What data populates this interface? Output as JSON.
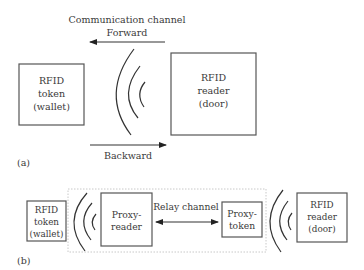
{
  "figure": {
    "part_a": {
      "label": "(a)",
      "channel_title": "Communication channel",
      "forward_label": "Forward",
      "backward_label": "Backward",
      "token": {
        "line1": "RFID",
        "line2": "token",
        "line3": "(wallet)"
      },
      "reader": {
        "line1": "RFID",
        "line2": "reader",
        "line3": "(door)"
      }
    },
    "part_b": {
      "label": "(b)",
      "relay_label": "Relay channel",
      "token": {
        "line1": "RFID",
        "line2": "token",
        "line3": "(wallet)"
      },
      "proxy_reader": {
        "line1": "Proxy-",
        "line2": "reader"
      },
      "proxy_token": {
        "line1": "Proxy-",
        "line2": "token"
      },
      "reader": {
        "line1": "RFID",
        "line2": "reader",
        "line3": "(door)"
      }
    }
  }
}
